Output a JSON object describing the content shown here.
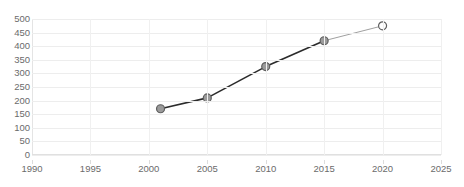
{
  "chart_data": {
    "type": "line",
    "title": "",
    "xlabel": "",
    "ylabel": "",
    "x": [
      2001,
      2005,
      2010,
      2015,
      2020
    ],
    "values": [
      170,
      210,
      325,
      420,
      475
    ],
    "xlim": [
      1990,
      2025
    ],
    "ylim": [
      0,
      500
    ],
    "xticks": [
      "1990",
      "1995",
      "2000",
      "2005",
      "2010",
      "2015",
      "2020",
      "2025"
    ],
    "yticks": [
      "500",
      "450",
      "400",
      "350",
      "300",
      "250",
      "200",
      "150",
      "100",
      "50",
      "0"
    ],
    "grid": true,
    "legend": "none",
    "series": [
      {
        "name": "series-1",
        "values": [
          170,
          210,
          325,
          420,
          475
        ]
      }
    ],
    "style": {
      "line_color": "#2b2b2b",
      "line_color_last_segment": "#a0a0a0",
      "marker_fill": "#9b9b9b",
      "marker_edge": "#5e5e5e",
      "marker_fill_last": "#ffffff",
      "grid_color": "#ededed",
      "tick_label_color": "#6b6b6b",
      "background": "#ffffff"
    }
  }
}
